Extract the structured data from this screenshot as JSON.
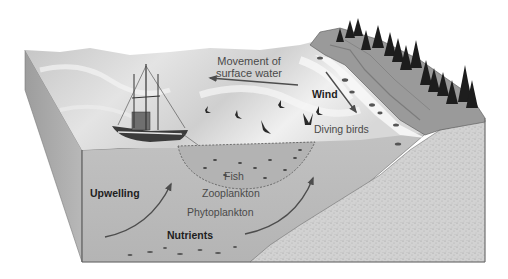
{
  "diagram": {
    "type": "block-diagram",
    "colors": {
      "background": "#ffffff",
      "water_surface_light": "#e6e6e6",
      "water_surface_dark": "#b9b9b9",
      "water_body": "#bdbdbd",
      "water_side": "#a9a9a9",
      "sediment": "#cfcfcf",
      "sediment_speckle": "#9a9a9a",
      "cliff": "#8f8f8f",
      "trees": "#1c1c1c",
      "arrow": "#4d4d4d",
      "text": "#4a4a4a",
      "text_bold": "#1e1e1e"
    },
    "labels": {
      "movement_line1": "Movement of",
      "movement_line2": "surface water",
      "wind": "Wind",
      "diving_birds": "Diving birds",
      "fish": "Fish",
      "zooplankton": "Zooplankton",
      "phytoplankton": "Phytoplankton",
      "nutrients": "Nutrients",
      "upwelling": "Upwelling"
    },
    "elements": {
      "fishing_boat": "trawler",
      "net": "trawl-net",
      "birds_count": 6,
      "trees": "conifer-forest",
      "coast": "rocky-cliff"
    }
  }
}
